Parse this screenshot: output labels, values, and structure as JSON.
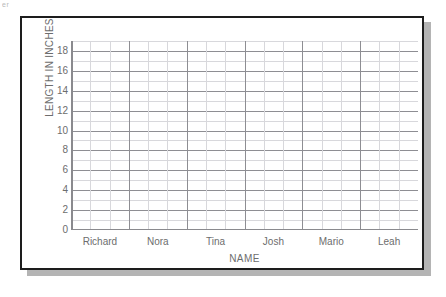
{
  "scan": {
    "artifact_text": "er"
  },
  "chart_data": {
    "type": "bar",
    "title": "",
    "subtitle": "",
    "xlabel": "NAME",
    "ylabel": "LENGTH IN INCHES",
    "categories": [
      "Richard",
      "Nora",
      "Tina",
      "Josh",
      "Mario",
      "Leah"
    ],
    "values": [
      null,
      null,
      null,
      null,
      null,
      null
    ],
    "series": [
      {
        "name": "Length",
        "values": [
          null,
          null,
          null,
          null,
          null,
          null
        ]
      }
    ],
    "ylim": [
      0,
      19
    ],
    "y_ticks": [
      0,
      2,
      4,
      6,
      8,
      10,
      12,
      14,
      16,
      18
    ],
    "y_tick_labels": [
      "0",
      "2",
      "4",
      "6",
      "8",
      "10",
      "12",
      "14",
      "16",
      "18"
    ],
    "y_step": 2,
    "grid": true,
    "grid_columns": 18,
    "grid_columns_per_category": 3,
    "legend": "none",
    "note": "Empty grid template — no bars plotted; blank graph for student data entry"
  },
  "colors": {
    "frame_border": "#1d1d1d",
    "shadow": "#b4b4b4",
    "plot_background": "#ffffff",
    "grid_major": "#8e8e93",
    "grid_minor": "#d8d8dc",
    "axis_line": "#8a8a8e",
    "text": "#6d6d6d",
    "page_background": "#ffffff"
  }
}
